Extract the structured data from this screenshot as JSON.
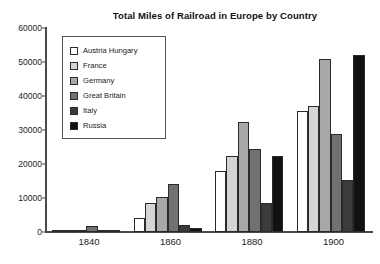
{
  "chart_data": {
    "type": "bar",
    "title": "Total Miles of Railroad in Europe by Country",
    "xlabel": "",
    "ylabel": "",
    "categories": [
      "1840",
      "1860",
      "1880",
      "1900"
    ],
    "ylim": [
      0,
      60000
    ],
    "yticks": [
      0,
      10000,
      20000,
      30000,
      40000,
      50000,
      60000
    ],
    "ytick_labels": [
      "0",
      "10000",
      "20000",
      "30000",
      "40000",
      "50000",
      "60000"
    ],
    "grid": false,
    "legend_position": "upper-left",
    "series": [
      {
        "name": "Austria Hungary",
        "color": "#ffffff",
        "values": [
          100,
          4000,
          18000,
          35500
        ]
      },
      {
        "name": "France",
        "color": "#d4d4d4",
        "values": [
          500,
          8500,
          22300,
          37000
        ]
      },
      {
        "name": "Germany",
        "color": "#a8a8a8",
        "values": [
          350,
          10200,
          32500,
          50800
        ]
      },
      {
        "name": "Great Britain",
        "color": "#717171",
        "values": [
          1800,
          14000,
          24500,
          28800
        ]
      },
      {
        "name": "Italy",
        "color": "#3b3b3b",
        "values": [
          150,
          2000,
          8400,
          15300
        ]
      },
      {
        "name": "Russia",
        "color": "#111111",
        "values": [
          200,
          1200,
          22300,
          52200
        ]
      }
    ]
  }
}
